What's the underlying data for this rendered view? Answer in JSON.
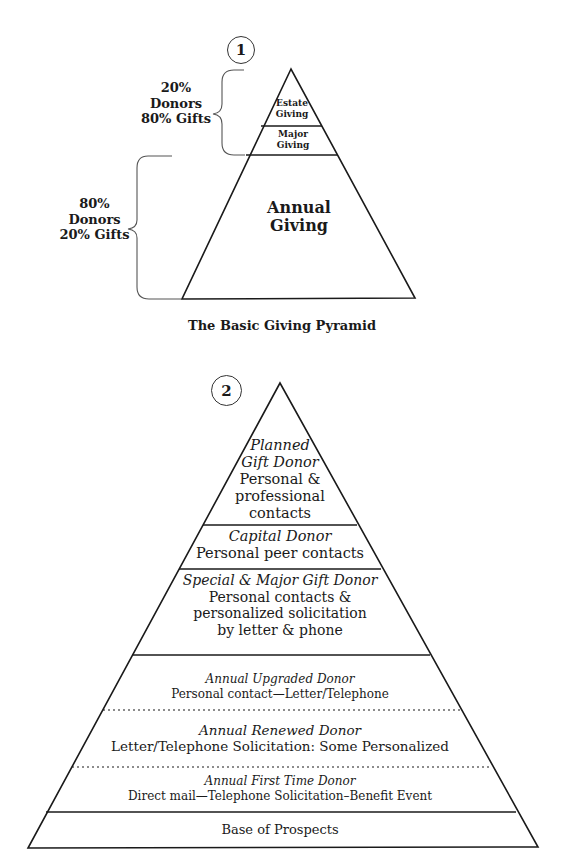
{
  "pyramid1": {
    "badge": "1",
    "caption": "The Basic Giving Pyramid",
    "tiers": [
      {
        "line1": "Estate",
        "line2": "Giving"
      },
      {
        "line1": "Major",
        "line2": "Giving"
      },
      {
        "line1": "Annual",
        "line2": "Giving"
      }
    ],
    "brace_top": {
      "line1": "20%",
      "line2": "Donors",
      "line3": "80% Gifts"
    },
    "brace_bottom": {
      "line1": "80%",
      "line2": "Donors",
      "line3": "20% Gifts"
    }
  },
  "pyramid2": {
    "badge": "2",
    "tiers": [
      {
        "title_line1": "Planned",
        "title_line2": "Gift Donor",
        "desc_line1": "Personal &",
        "desc_line2": "professional",
        "desc_line3": "contacts"
      },
      {
        "title": "Capital Donor",
        "desc": "Personal peer contacts"
      },
      {
        "title": "Special & Major Gift Donor",
        "desc_line1": "Personal contacts &",
        "desc_line2": "personalized solicitation",
        "desc_line3": "by letter & phone"
      },
      {
        "title": "Annual Upgraded Donor",
        "desc": "Personal contact—Letter/Telephone"
      },
      {
        "title": "Annual Renewed Donor",
        "desc": "Letter/Telephone Solicitation: Some Personalized"
      },
      {
        "title": "Annual First Time Donor",
        "desc": "Direct mail—Telephone Solicitation–Benefit Event"
      },
      {
        "desc": "Base of Prospects"
      }
    ]
  }
}
